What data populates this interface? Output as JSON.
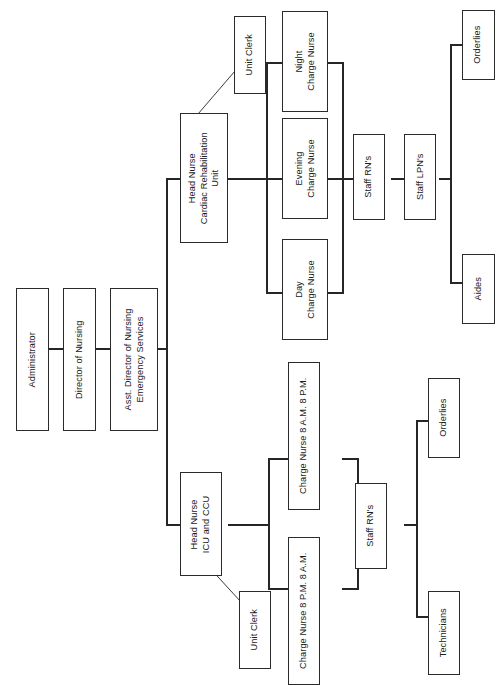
{
  "document": {
    "type": "organizational-chart",
    "title": "Nursing Department Organizational Chart",
    "orientation": "text-rotated-90-ccw",
    "background_color": "#ffffff",
    "line_color": "#262626",
    "box_border_color": "#2b2b2b",
    "text_color": "#1a1a1a"
  },
  "nodes": {
    "administrator": {
      "label": "Administrator"
    },
    "director_of_nursing": {
      "label": "Director of Nursing"
    },
    "asst_director": {
      "label": "Asst. Director of Nursing\nEmergency Services",
      "line1": "Asst. Director of Nursing",
      "line2": "Emergency Services"
    },
    "head_nurse_cardiac": {
      "line1": "Head Nurse",
      "line2": "Cardiac Rehabilitation",
      "line3": "Unit"
    },
    "unit_clerk_cardiac": {
      "label": "Unit Clerk"
    },
    "night_charge_nurse": {
      "line1": "Night",
      "line2": "Charge Nurse"
    },
    "evening_charge_nurse": {
      "line1": "Evening",
      "line2": "Charge Nurse"
    },
    "day_charge_nurse": {
      "line1": "Day",
      "line2": "Charge Nurse"
    },
    "staff_rns_upper": {
      "label": "Staff RN's"
    },
    "staff_lpns_upper": {
      "label": "Staff LPN's"
    },
    "orderlies_upper": {
      "label": "Orderlies"
    },
    "aides_upper": {
      "label": "Aides"
    },
    "head_nurse_icu": {
      "line1": "Head Nurse",
      "line2": "ICU and CCU"
    },
    "unit_clerk_icu": {
      "label": "Unit Clerk"
    },
    "charge_nurse_day_shift": {
      "label": "Charge Nurse 8 A.M.  8 P.M."
    },
    "charge_nurse_night_shift": {
      "label": "Charge Nurse 8 P.M.  8 A.M."
    },
    "staff_rns_lower": {
      "label": "Staff RN's"
    },
    "orderlies_lower": {
      "label": "Orderlies"
    },
    "technicians_lower": {
      "label": "Technicians"
    }
  },
  "hierarchy": [
    {
      "parent": "administrator",
      "child": "director_of_nursing"
    },
    {
      "parent": "director_of_nursing",
      "child": "asst_director"
    },
    {
      "parent": "asst_director",
      "child": "head_nurse_cardiac"
    },
    {
      "parent": "asst_director",
      "child": "head_nurse_icu"
    },
    {
      "parent": "head_nurse_cardiac",
      "child": "unit_clerk_cardiac"
    },
    {
      "parent": "head_nurse_cardiac",
      "child": "night_charge_nurse"
    },
    {
      "parent": "head_nurse_cardiac",
      "child": "evening_charge_nurse"
    },
    {
      "parent": "head_nurse_cardiac",
      "child": "day_charge_nurse"
    },
    {
      "parent": "evening_charge_nurse",
      "child": "staff_rns_upper"
    },
    {
      "parent": "staff_rns_upper",
      "child": "staff_lpns_upper"
    },
    {
      "parent": "staff_lpns_upper",
      "child": "orderlies_upper"
    },
    {
      "parent": "staff_lpns_upper",
      "child": "aides_upper"
    },
    {
      "parent": "head_nurse_icu",
      "child": "unit_clerk_icu"
    },
    {
      "parent": "head_nurse_icu",
      "child": "charge_nurse_day_shift"
    },
    {
      "parent": "head_nurse_icu",
      "child": "charge_nurse_night_shift"
    },
    {
      "parent": "charge_nurse_day_shift",
      "child": "staff_rns_lower"
    },
    {
      "parent": "charge_nurse_night_shift",
      "child": "staff_rns_lower"
    },
    {
      "parent": "staff_rns_lower",
      "child": "orderlies_lower"
    },
    {
      "parent": "staff_rns_lower",
      "child": "technicians_lower"
    }
  ]
}
